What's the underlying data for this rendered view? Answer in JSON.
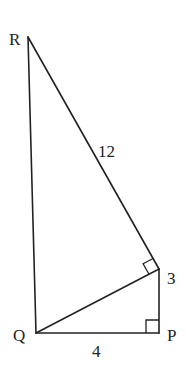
{
  "figure": {
    "type": "geometry-diagram",
    "vertices": {
      "R": {
        "label": "R"
      },
      "Q": {
        "label": "Q"
      },
      "P": {
        "label": "P"
      },
      "S": {
        "label": ""
      }
    },
    "segments": [
      {
        "from": "R",
        "to": "Q",
        "label": ""
      },
      {
        "from": "R",
        "to": "S",
        "label": "12"
      },
      {
        "from": "S",
        "to": "P",
        "label": "3"
      },
      {
        "from": "Q",
        "to": "P",
        "label": "4"
      },
      {
        "from": "Q",
        "to": "S",
        "label": ""
      }
    ],
    "right_angles": [
      {
        "at": "P",
        "between": [
          "Q",
          "S"
        ]
      },
      {
        "at": "S",
        "between": [
          "Q",
          "R"
        ]
      }
    ]
  }
}
